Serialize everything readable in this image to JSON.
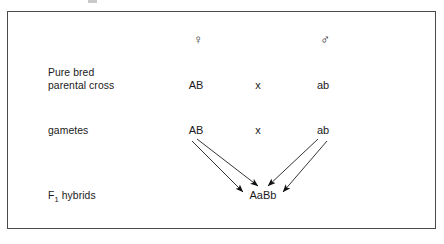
{
  "diagram": {
    "frame_color": "#4a4a4a",
    "text_color": "#1a1a1a",
    "symbols": {
      "female": "♀",
      "female_name": "female-symbol",
      "male": "♂",
      "male_name": "male-symbol"
    },
    "rows": [
      {
        "label_line1": "Pure bred",
        "label_line2": "parental cross",
        "left": "AB",
        "operator": "x",
        "right": "ab"
      },
      {
        "label_line1": "gametes",
        "label_line2": "",
        "left": "AB",
        "operator": "x",
        "right": "ab"
      }
    ],
    "f1": {
      "label_prefix": "F",
      "label_subscript": "1",
      "label_suffix": " hybrids",
      "genotype": "AaBb"
    },
    "arrows": [
      {
        "name": "arrow-ab-to-center",
        "from": "AB",
        "to": "AaBb",
        "x1": 197,
        "y1": 139,
        "x2": 258,
        "y2": 186
      },
      {
        "name": "arrow-ab-to-left",
        "from": "AB",
        "to": "AaBb",
        "x1": 192,
        "y1": 141,
        "x2": 243,
        "y2": 192
      },
      {
        "name": "arrow-ab2-to-center",
        "from": "ab",
        "to": "AaBb",
        "x1": 318,
        "y1": 139,
        "x2": 268,
        "y2": 186
      },
      {
        "name": "arrow-ab2-to-right",
        "from": "ab",
        "to": "AaBb",
        "x1": 327,
        "y1": 141,
        "x2": 283,
        "y2": 192
      }
    ]
  }
}
